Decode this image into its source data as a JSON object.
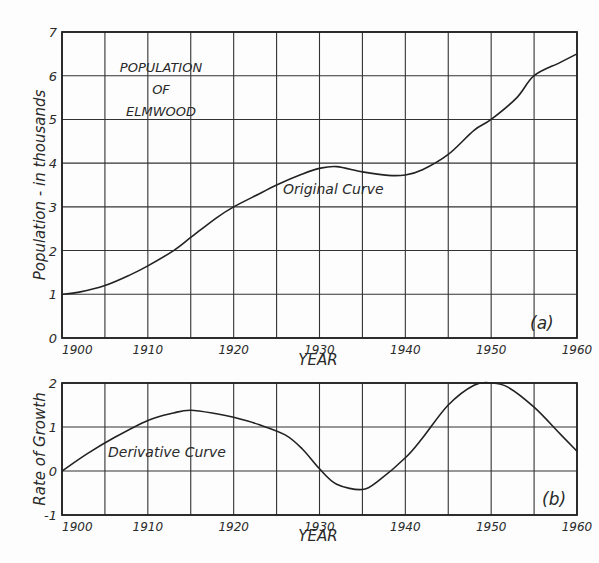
{
  "chart_data": [
    {
      "type": "line",
      "panel": "a",
      "panel_label": "(a)",
      "title": "POPULATION OF ELMWOOD",
      "title_lines": [
        "POPULATION",
        "OF",
        "ELMWOOD"
      ],
      "curve_label": "Original Curve",
      "xlabel": "YEAR",
      "ylabel": "Population - in thousands",
      "xlim": [
        1900,
        1960
      ],
      "ylim": [
        0,
        7
      ],
      "x_ticks": [
        1900,
        1910,
        1920,
        1930,
        1940,
        1950,
        1960
      ],
      "y_ticks": [
        0,
        1,
        2,
        3,
        4,
        5,
        6,
        7
      ],
      "grid": true,
      "x_grid_step": 5,
      "series": [
        {
          "name": "Original Curve",
          "x": [
            1900,
            1902,
            1905,
            1908,
            1910,
            1913,
            1915,
            1918,
            1920,
            1923,
            1925,
            1928,
            1930,
            1932,
            1935,
            1938,
            1940,
            1942,
            1945,
            1948,
            1950,
            1953,
            1955,
            1958,
            1960
          ],
          "y": [
            1.0,
            1.05,
            1.2,
            1.45,
            1.65,
            2.0,
            2.3,
            2.75,
            3.0,
            3.3,
            3.5,
            3.75,
            3.88,
            3.92,
            3.8,
            3.72,
            3.73,
            3.85,
            4.2,
            4.75,
            5.0,
            5.5,
            6.0,
            6.3,
            6.5
          ]
        }
      ]
    },
    {
      "type": "line",
      "panel": "b",
      "panel_label": "(b)",
      "curve_label": "Derivative Curve",
      "xlabel": "YEAR",
      "ylabel": "Rate of Growth",
      "xlim": [
        1900,
        1960
      ],
      "ylim": [
        -1,
        2
      ],
      "x_ticks": [
        1900,
        1910,
        1920,
        1930,
        1940,
        1950,
        1960
      ],
      "y_ticks": [
        -1,
        0,
        1,
        2
      ],
      "grid": true,
      "x_grid_step": 5,
      "series": [
        {
          "name": "Derivative Curve",
          "x": [
            1900,
            1903,
            1906,
            1910,
            1913,
            1915,
            1918,
            1920,
            1923,
            1926,
            1928,
            1930,
            1932,
            1935,
            1937,
            1940,
            1942,
            1945,
            1948,
            1950,
            1952,
            1955,
            1958,
            1960
          ],
          "y": [
            0.0,
            0.4,
            0.75,
            1.15,
            1.32,
            1.38,
            1.3,
            1.22,
            1.05,
            0.82,
            0.5,
            0.05,
            -0.3,
            -0.42,
            -0.2,
            0.3,
            0.75,
            1.5,
            1.95,
            2.0,
            1.9,
            1.45,
            0.85,
            0.45
          ]
        }
      ]
    }
  ]
}
